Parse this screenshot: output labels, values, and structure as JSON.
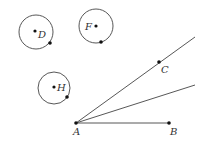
{
  "diagram": {
    "colors": {
      "line": "#444444",
      "point": "#111111",
      "label": "#333333",
      "background": "#ffffff"
    },
    "circles": [
      {
        "name": "D",
        "label": "D",
        "cx": 36,
        "cy": 32,
        "r": 17,
        "center_point": [
          35,
          31
        ],
        "boundary_point": [
          50,
          43
        ],
        "label_pos": [
          38,
          38
        ]
      },
      {
        "name": "F",
        "label": "F",
        "cx": 96,
        "cy": 26,
        "r": 17,
        "center_point": [
          96,
          26
        ],
        "boundary_point": [
          101,
          42
        ],
        "label_pos": [
          85,
          30
        ]
      },
      {
        "name": "H",
        "label": "H",
        "cx": 54,
        "cy": 88,
        "r": 16,
        "center_point": [
          54,
          87
        ],
        "boundary_point": [
          67,
          97
        ],
        "label_pos": [
          57,
          91
        ]
      }
    ],
    "points": [
      {
        "name": "A",
        "label": "A",
        "x": 76,
        "y": 123,
        "label_pos": [
          73,
          135
        ]
      },
      {
        "name": "B",
        "label": "B",
        "x": 169,
        "y": 123,
        "label_pos": [
          170,
          135
        ]
      },
      {
        "name": "C",
        "label": "C",
        "x": 159,
        "y": 62,
        "label_pos": [
          161,
          73
        ]
      }
    ],
    "segments": [
      {
        "name": "ray-AC",
        "from": [
          76,
          123
        ],
        "to": [
          195,
          37
        ]
      },
      {
        "name": "ray-A-lower",
        "from": [
          76,
          123
        ],
        "to": [
          195,
          85
        ]
      },
      {
        "name": "segment-AB",
        "from": [
          76,
          123
        ],
        "to": [
          169,
          123
        ]
      }
    ]
  }
}
